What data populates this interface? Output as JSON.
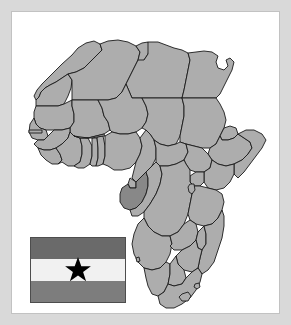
{
  "image": {
    "title": "Map of Africa with highlighted country and national flag",
    "width": 291,
    "height": 325
  },
  "frame": {
    "outer_background_color": "#d9d9d9",
    "panel_background_color": "#ffffff",
    "panel_border_color": "#c2c2c2"
  },
  "map": {
    "name": "africa-continent-map",
    "continent": "Africa",
    "land_fill_color": "#adadad",
    "border_stroke_color": "#1a1a1a",
    "highlight_fill_color": "#888888",
    "highlighted_country": "Gabon",
    "highlighted_region_label": "Central Africa / Gulf of Guinea",
    "projection_note": "country outlines with internal national borders",
    "visible_features": [
      "Lesotho enclave",
      "Horn of Africa",
      "Gulf of Guinea",
      "Gambia sliver",
      "Sinai peninsula"
    ]
  },
  "flag": {
    "name": "national-flag",
    "orientation": "horizontal tricolor",
    "bands": [
      {
        "position": "top",
        "color": "#6a6a6a"
      },
      {
        "position": "middle",
        "color": "#f1f1f1"
      },
      {
        "position": "bottom",
        "color": "#7d7d7d"
      }
    ],
    "emblem": "five-pointed star",
    "emblem_color": "#000000",
    "emblem_position": "centered in middle band",
    "border_color": "#4d4d4d"
  }
}
